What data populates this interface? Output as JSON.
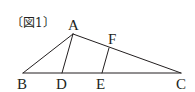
{
  "figure": {
    "caption": "〔図1〕",
    "line_color": "#231f20",
    "points": {
      "A": {
        "label": "A",
        "x": 73,
        "y": 34
      },
      "B": {
        "label": "B",
        "x": 23,
        "y": 73
      },
      "C": {
        "label": "C",
        "x": 181,
        "y": 73
      },
      "D": {
        "label": "D",
        "x": 62,
        "y": 73
      },
      "E": {
        "label": "E",
        "x": 102,
        "y": 73
      },
      "F": {
        "label": "F",
        "x": 109,
        "y": 48
      }
    },
    "segments": [
      [
        "A",
        "B"
      ],
      [
        "A",
        "C"
      ],
      [
        "B",
        "C"
      ],
      [
        "A",
        "D"
      ],
      [
        "E",
        "F"
      ]
    ]
  }
}
